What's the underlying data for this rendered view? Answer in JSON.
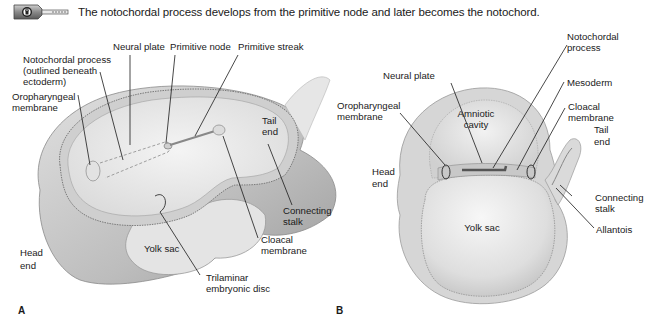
{
  "header": {
    "icon": "key-lock-icon",
    "caption": "The notochordal process develops from the primitive node and later becomes the notochord."
  },
  "figure_a": {
    "panel_label": "A",
    "labels": {
      "neural_plate": "Neural plate",
      "primitive_node": "Primitive node",
      "primitive_streak": "Primitive streak",
      "notochordal_1": "Notochordal process",
      "notochordal_2": "(outlined beneath",
      "notochordal_3": "ectoderm)",
      "oropharyngeal_1": "Oropharyngeal",
      "oropharyngeal_2": "membrane",
      "tail_1": "Tail",
      "tail_2": "end",
      "connecting_1": "Connecting",
      "connecting_2": "stalk",
      "cloacal_1": "Cloacal",
      "cloacal_2": "membrane",
      "yolk_sac": "Yolk sac",
      "head_1": "Head",
      "head_2": "end",
      "trilaminar_1": "Trilaminar",
      "trilaminar_2": "embryonic disc"
    }
  },
  "figure_b": {
    "panel_label": "B",
    "labels": {
      "notochordal_1": "Notochordal",
      "notochordal_2": "process",
      "neural_plate": "Neural plate",
      "mesoderm": "Mesoderm",
      "oropharyngeal_1": "Oropharyngeal",
      "oropharyngeal_2": "membrane",
      "amniotic_1": "Amniotic",
      "amniotic_2": "cavity",
      "cloacal_1": "Cloacal",
      "cloacal_2": "membrane",
      "tail_1": "Tail",
      "tail_2": "end",
      "head_1": "Head",
      "head_2": "end",
      "connecting_1": "Connecting",
      "connecting_2": "stalk",
      "yolk_sac": "Yolk sac",
      "allantois": "Allantois"
    }
  }
}
